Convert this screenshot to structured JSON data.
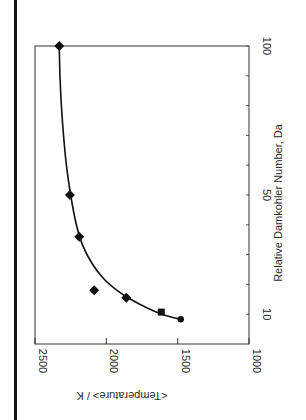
{
  "chart_data": {
    "type": "scatter",
    "orientation": "rotated-90-ccw",
    "title": "",
    "xlabel": "Relative Damkohler Number, Da",
    "ylabel": "<Temperature> / K",
    "xlim": [
      0,
      100
    ],
    "ylim": [
      1000,
      2500
    ],
    "x_ticks": [
      10,
      20,
      30,
      40,
      50,
      60,
      70,
      80,
      90,
      100
    ],
    "x_tick_labels": [
      "10",
      "50",
      "100"
    ],
    "y_ticks": [
      1000,
      1500,
      2000,
      2500
    ],
    "y_tick_labels": [
      "1000",
      "1500",
      "2000",
      "2500"
    ],
    "grid": false,
    "series": [
      {
        "name": "diamond",
        "marker": "diamond",
        "points": [
          {
            "x": 100,
            "y": 2330
          },
          {
            "x": 50,
            "y": 2255
          },
          {
            "x": 36,
            "y": 2190
          },
          {
            "x": 18,
            "y": 2085
          },
          {
            "x": 15.5,
            "y": 1860
          }
        ]
      },
      {
        "name": "square",
        "marker": "square",
        "points": [
          {
            "x": 10.7,
            "y": 1615
          }
        ]
      },
      {
        "name": "circle",
        "marker": "circle",
        "points": [
          {
            "x": 8.3,
            "y": 1478
          }
        ]
      },
      {
        "name": "fit",
        "marker": "line",
        "points": [
          {
            "x": 8.3,
            "y": 1478
          },
          {
            "x": 9,
            "y": 1540
          },
          {
            "x": 10,
            "y": 1610
          },
          {
            "x": 12,
            "y": 1710
          },
          {
            "x": 15,
            "y": 1830
          },
          {
            "x": 18,
            "y": 1925
          },
          {
            "x": 22,
            "y": 2020
          },
          {
            "x": 27,
            "y": 2100
          },
          {
            "x": 33,
            "y": 2165
          },
          {
            "x": 40,
            "y": 2210
          },
          {
            "x": 50,
            "y": 2250
          },
          {
            "x": 60,
            "y": 2280
          },
          {
            "x": 70,
            "y": 2300
          },
          {
            "x": 80,
            "y": 2315
          },
          {
            "x": 90,
            "y": 2325
          },
          {
            "x": 100,
            "y": 2330
          }
        ]
      }
    ]
  }
}
